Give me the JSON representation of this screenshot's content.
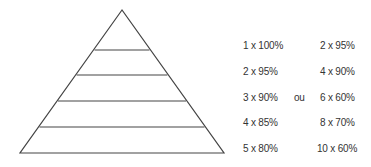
{
  "diagram": {
    "type": "pyramid",
    "levels": 5,
    "stroke_color": "#444444",
    "apex": [
      122,
      10
    ],
    "base": [
      [
        20,
        153
      ],
      [
        224,
        153
      ]
    ],
    "divider_y": [
      50,
      75,
      101,
      127
    ]
  },
  "schemes": {
    "left": [
      "1 x 100%",
      "2 x 95%",
      "3 x 90%",
      "4 x 85%",
      "5 x 80%"
    ],
    "separator": "ou",
    "right": [
      "2 x 95%",
      "4 x 90%",
      "6 x 60%",
      "8 x 70%",
      "10 x 60%"
    ]
  }
}
